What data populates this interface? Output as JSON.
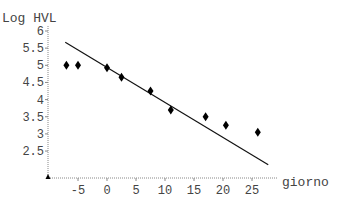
{
  "chart_data": {
    "type": "scatter",
    "title": "",
    "xlabel": "giorno",
    "ylabel": "Log HVL",
    "xlim": [
      -9.5,
      28
    ],
    "ylim": [
      2.0,
      6.0
    ],
    "x_ticks": [
      -5,
      0,
      5,
      10,
      15,
      20,
      25
    ],
    "y_ticks": [
      2.5,
      3,
      3.5,
      4,
      4.5,
      5,
      5.5,
      6
    ],
    "grid": false,
    "legend": null,
    "series": [
      {
        "name": "observations",
        "kind": "scatter",
        "marker": "diamond",
        "x": [
          -7,
          -5,
          0,
          2.5,
          7.5,
          11,
          17,
          20.5,
          26
        ],
        "y": [
          5.0,
          5.0,
          4.93,
          4.65,
          4.25,
          3.7,
          3.5,
          3.25,
          3.05
        ]
      },
      {
        "name": "fit",
        "kind": "line",
        "x": [
          -7.2,
          27.8
        ],
        "y": [
          5.67,
          2.1
        ]
      }
    ]
  },
  "axes": {
    "ylabel": "Log HVL",
    "xlabel": "giorno",
    "ytick_labels": [
      "2.5",
      "3",
      "3.5",
      "4",
      "4.5",
      "5",
      "5.5",
      "6"
    ],
    "xtick_labels": [
      "-5",
      "0",
      "5",
      "10",
      "15",
      "20",
      "25"
    ]
  }
}
